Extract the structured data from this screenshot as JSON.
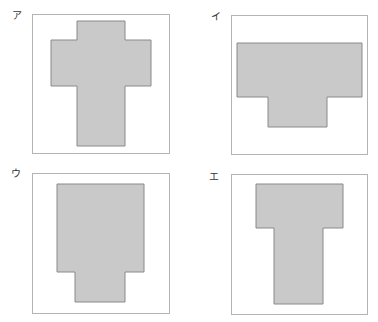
{
  "colors": {
    "shape_fill": "#c9c9c9",
    "shape_stroke": "#8a8a8a",
    "box_border": "#b4b4b4"
  },
  "panels": [
    {
      "label": "ア",
      "label_pos": [
        12,
        11
      ],
      "box": {
        "x": 32,
        "y": 14,
        "w": 138,
        "h": 140
      },
      "shape_points": "77,21 125,21 125,40 151,40 151,86 125,86 125,146 77,146 77,86 51,86 51,40 77,40"
    },
    {
      "label": "イ",
      "label_pos": [
        211,
        12
      ],
      "box": {
        "x": 231,
        "y": 15,
        "w": 137,
        "h": 140
      },
      "shape_points": "237,43 362,43 362,97 327,97 327,127 268,127 268,97 237,97"
    },
    {
      "label": "ウ",
      "label_pos": [
        11,
        169
      ],
      "box": {
        "x": 32,
        "y": 173,
        "w": 138,
        "h": 141
      },
      "shape_points": "57,184 144,184 144,272 125,272 125,302 75,302 75,272 57,272"
    },
    {
      "label": "エ",
      "label_pos": [
        209,
        172
      ],
      "box": {
        "x": 231,
        "y": 174,
        "w": 137,
        "h": 141
      },
      "shape_points": "256,184 343,184 343,228 323,228 323,304 274,304 274,228 256,228"
    }
  ]
}
